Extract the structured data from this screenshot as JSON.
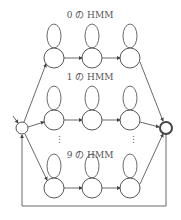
{
  "diagram": {
    "type": "hmm-network",
    "models": [
      {
        "label": "0 の HMM",
        "states": 3
      },
      {
        "label": "1 の HMM",
        "states": 3
      },
      {
        "label": "9 の HMM",
        "states": 3
      }
    ],
    "ellipsis": "⋮",
    "start_node": "initial",
    "end_node": "final",
    "feedback_loop": true
  },
  "colors": {
    "stroke": "#444444",
    "text": "#555555",
    "background": "#ffffff"
  }
}
